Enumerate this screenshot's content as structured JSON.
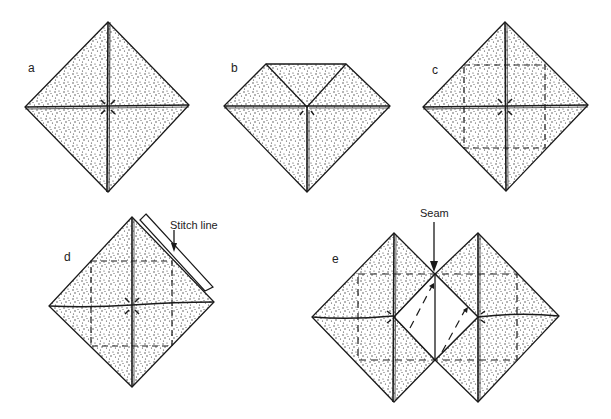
{
  "figure": {
    "panels": [
      {
        "id": "a",
        "label": "a",
        "description": "Square fabric piece with diagonal creases, folded corners pointing to center"
      },
      {
        "id": "b",
        "label": "b",
        "description": "Top corner folded down to center"
      },
      {
        "id": "c",
        "label": "c",
        "description": "Square with dashed stitch outline"
      },
      {
        "id": "d",
        "label": "d",
        "description": "Two squares stitched along stitch line"
      },
      {
        "id": "e",
        "label": "e",
        "description": "Opened pieces joined at seam"
      }
    ],
    "annotations": {
      "stitch_line": "Stitch line",
      "seam": "Seam"
    }
  },
  "colors": {
    "ink": "#1a1a1a",
    "fabric_stipple": "#333333",
    "background": "#ffffff"
  }
}
